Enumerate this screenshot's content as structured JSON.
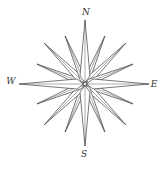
{
  "diagram": {
    "type": "compass-rose",
    "center": [
      85,
      84
    ],
    "stroke_color": "#555555",
    "fill_color": "#ffffff",
    "labels": {
      "north": "N",
      "east": "E",
      "south": "S",
      "west": "W"
    },
    "label_positions": {
      "north": [
        86,
        12
      ],
      "east": [
        154,
        84
      ],
      "south": [
        84,
        154
      ],
      "west": [
        11,
        81
      ]
    },
    "points": [
      {
        "name": "N",
        "angle": 0,
        "length": 64,
        "half_width": 5
      },
      {
        "name": "NNE",
        "angle": 22.5,
        "length": 52,
        "half_width": 3
      },
      {
        "name": "NE",
        "angle": 45,
        "length": 58,
        "half_width": 3.5
      },
      {
        "name": "ENE",
        "angle": 67.5,
        "length": 52,
        "half_width": 3
      },
      {
        "name": "E",
        "angle": 90,
        "length": 64,
        "half_width": 5
      },
      {
        "name": "ESE",
        "angle": 112.5,
        "length": 52,
        "half_width": 3
      },
      {
        "name": "SE",
        "angle": 135,
        "length": 58,
        "half_width": 3.5
      },
      {
        "name": "SSE",
        "angle": 157.5,
        "length": 52,
        "half_width": 3
      },
      {
        "name": "S",
        "angle": 180,
        "length": 62,
        "half_width": 5
      },
      {
        "name": "SSW",
        "angle": 202.5,
        "length": 52,
        "half_width": 3
      },
      {
        "name": "SW",
        "angle": 225,
        "length": 58,
        "half_width": 3.5
      },
      {
        "name": "WSW",
        "angle": 247.5,
        "length": 52,
        "half_width": 3
      },
      {
        "name": "W",
        "angle": 270,
        "length": 66,
        "half_width": 5
      },
      {
        "name": "WNW",
        "angle": 292.5,
        "length": 52,
        "half_width": 3
      },
      {
        "name": "NW",
        "angle": 315,
        "length": 58,
        "half_width": 3.5
      },
      {
        "name": "NNW",
        "angle": 337.5,
        "length": 52,
        "half_width": 3
      }
    ]
  }
}
